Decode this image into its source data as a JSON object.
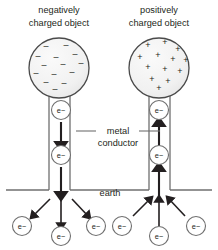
{
  "figure": {
    "title_left": "negatively\ncharged object",
    "title_right": "positively\ncharged object",
    "captions": {
      "left_line1": "negatively",
      "left_line2": "charged object",
      "right_line1": "positively",
      "right_line2": "charged object"
    },
    "labels": {
      "conductor_line1": "metal",
      "conductor_line2": "conductor",
      "earth": "earth"
    },
    "electron_symbol": "e−",
    "charge_symbols": {
      "negative": "–",
      "positive": "+"
    },
    "colors": {
      "stroke": "#231f20",
      "sphere_fill": "#f0f0f0",
      "conductor_fill": "#ffffff",
      "ground_line": "#6f6f6f",
      "leader_line": "#6f6f6f",
      "text": "#231f20"
    },
    "left_sphere": {
      "cx": 59,
      "cy": 68,
      "r": 30,
      "charge": "negative",
      "charge_count": 14,
      "charge_positions": [
        [
          46,
          49
        ],
        [
          66,
          48
        ],
        [
          38,
          59
        ],
        [
          56,
          60
        ],
        [
          75,
          57
        ],
        [
          44,
          68
        ],
        [
          63,
          67
        ],
        [
          81,
          66
        ],
        [
          36,
          76
        ],
        [
          54,
          77
        ],
        [
          72,
          75
        ],
        [
          46,
          85
        ],
        [
          64,
          86
        ],
        [
          55,
          92
        ]
      ]
    },
    "right_sphere": {
      "cx": 159,
      "cy": 68,
      "r": 30,
      "charge": "positive",
      "charge_count": 13,
      "charge_positions": [
        [
          148,
          48
        ],
        [
          165,
          45
        ],
        [
          178,
          52
        ],
        [
          140,
          60
        ],
        [
          158,
          58
        ],
        [
          173,
          62
        ],
        [
          186,
          63
        ],
        [
          148,
          70
        ],
        [
          165,
          72
        ],
        [
          180,
          74
        ],
        [
          152,
          82
        ],
        [
          168,
          84
        ],
        [
          159,
          91
        ]
      ]
    },
    "left_column": {
      "x_left": 49,
      "x_right": 70,
      "y_top": 95,
      "y_bottom": 190,
      "flow_direction": "down"
    },
    "right_column": {
      "x_left": 149,
      "x_right": 170,
      "y_top": 95,
      "y_bottom": 190,
      "flow_direction": "up"
    },
    "column_electrons_left": [
      {
        "cx": 61,
        "cy": 110
      },
      {
        "cx": 61,
        "cy": 155
      }
    ],
    "column_electrons_right": [
      {
        "cx": 159,
        "cy": 110
      },
      {
        "cx": 159,
        "cy": 155
      }
    ],
    "column_arrows_left": [
      {
        "x": 61,
        "y1": 122,
        "y2": 146
      },
      {
        "x": 61,
        "y1": 167,
        "y2": 196
      }
    ],
    "column_arrows_right": [
      {
        "x": 159,
        "y1": 146,
        "y2": 122
      },
      {
        "x": 159,
        "y1": 196,
        "y2": 167
      }
    ],
    "ground": {
      "y": 190,
      "segments": [
        {
          "x1": 6,
          "x2": 49
        },
        {
          "x1": 70,
          "x2": 149
        },
        {
          "x1": 170,
          "x2": 212
        }
      ],
      "label_x": 110,
      "label_y": 196
    },
    "free_electrons_left": [
      {
        "cx": 22,
        "cy": 226,
        "arrow_from": [
          50,
          199
        ],
        "arrow_to": [
          33,
          216
        ]
      },
      {
        "cx": 61,
        "cy": 236,
        "arrow_from": [
          61,
          199
        ],
        "arrow_to": [
          61,
          226
        ]
      },
      {
        "cx": 96,
        "cy": 226,
        "arrow_from": [
          72,
          199
        ],
        "arrow_to": [
          88,
          216
        ]
      }
    ],
    "free_electrons_right": [
      {
        "cx": 122,
        "cy": 226,
        "arrow_from": [
          133,
          216
        ],
        "arrow_to": [
          150,
          199
        ]
      },
      {
        "cx": 159,
        "cy": 236,
        "arrow_from": [
          159,
          226
        ],
        "arrow_to": [
          159,
          199
        ]
      },
      {
        "cx": 196,
        "cy": 226,
        "arrow_from": [
          185,
          216
        ],
        "arrow_to": [
          169,
          199
        ]
      }
    ],
    "leader_lines": {
      "left": {
        "x1": 76,
        "x2": 96,
        "y": 131
      },
      "right": {
        "x1": 139,
        "x2": 160,
        "y": 131
      },
      "text_x": 118,
      "text_y1": 134,
      "text_y2": 146
    },
    "electron_radius": 9.5,
    "free_electron_radius": 9.5
  }
}
